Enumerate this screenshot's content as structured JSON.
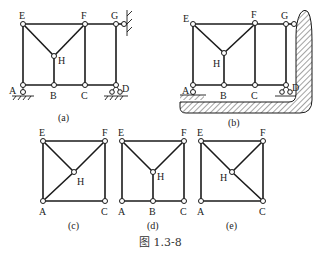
{
  "figure": {
    "caption": "图 1.3-8",
    "panels": [
      {
        "id": "a",
        "label": "(a)",
        "nodes": {
          "E": "E",
          "F": "F",
          "G": "G",
          "H": "H",
          "A": "A",
          "B": "B",
          "C": "C",
          "D": "D"
        },
        "members": [
          "E-F",
          "F-G",
          "E-A",
          "E-H",
          "F-H",
          "H-B",
          "F-C",
          "G-D",
          "A-B",
          "B-C",
          "C-D"
        ],
        "supports": [
          "A: pin to ground",
          "D: pin to ground",
          "G: pin to wall"
        ]
      },
      {
        "id": "b",
        "label": "(b)",
        "nodes": {
          "E": "E",
          "F": "F",
          "G": "G",
          "H": "H",
          "A": "A",
          "B": "B",
          "C": "C",
          "D": "D"
        },
        "members": [
          "E-F",
          "F-G",
          "E-A",
          "E-H",
          "F-H",
          "H-B",
          "F-C",
          "G-D",
          "A-B",
          "B-C",
          "C-D"
        ],
        "supports": [
          "A: pin to ground",
          "D: pin to rigid body",
          "G: pin to rigid body"
        ]
      },
      {
        "id": "c",
        "label": "(c)",
        "nodes": {
          "E": "E",
          "F": "F",
          "H": "H",
          "A": "A",
          "C": "C"
        },
        "members": [
          "E-F",
          "E-A",
          "F-C",
          "A-C",
          "E-H",
          "F-H",
          "A-H"
        ]
      },
      {
        "id": "d",
        "label": "(d)",
        "nodes": {
          "E": "E",
          "F": "F",
          "H": "H",
          "A": "A",
          "B": "B",
          "C": "C"
        },
        "members": [
          "E-F",
          "E-A",
          "F-C",
          "A-B",
          "B-C",
          "E-H",
          "F-H",
          "H-B"
        ]
      },
      {
        "id": "e",
        "label": "(e)",
        "nodes": {
          "E": "E",
          "F": "F",
          "H": "H",
          "A": "A",
          "C": "C"
        },
        "members": [
          "E-F",
          "E-A",
          "F-C",
          "A-C",
          "E-H",
          "F-H",
          "H-C"
        ]
      }
    ]
  }
}
